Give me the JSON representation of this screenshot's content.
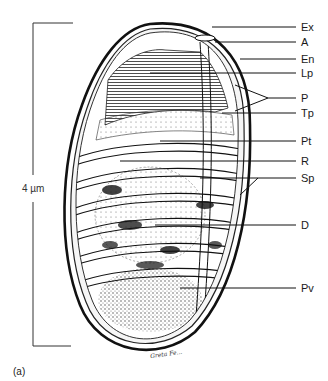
{
  "figure": {
    "panel_label": "(a)",
    "scale_bar": {
      "label": "4 µm"
    },
    "signature": "Greta Fe...",
    "labels": [
      {
        "id": "Ex",
        "text": "Ex",
        "y": 27
      },
      {
        "id": "A",
        "text": "A",
        "y": 42
      },
      {
        "id": "En",
        "text": "En",
        "y": 59
      },
      {
        "id": "Lp",
        "text": "Lp",
        "y": 73
      },
      {
        "id": "P",
        "text": "P",
        "y": 98
      },
      {
        "id": "Tp",
        "text": "Tp",
        "y": 113
      },
      {
        "id": "Pt",
        "text": "Pt",
        "y": 141
      },
      {
        "id": "R",
        "text": "R",
        "y": 161
      },
      {
        "id": "Sp",
        "text": "Sp",
        "y": 178
      },
      {
        "id": "D",
        "text": "D",
        "y": 225
      },
      {
        "id": "Pv",
        "text": "Pv",
        "y": 288
      }
    ]
  }
}
